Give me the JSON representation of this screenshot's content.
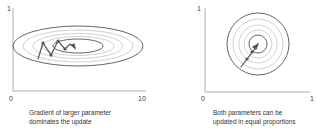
{
  "left_panel": {
    "y_tick_top": "1",
    "x_tick_left": "0",
    "x_tick_right": "10",
    "caption_line1": "Gradient of larger parameter",
    "caption_line2": "dominates the update"
  },
  "right_panel": {
    "y_tick_top": "1",
    "x_tick_left": "0",
    "x_tick_right": "1",
    "caption_line1": "Both parameters can be",
    "caption_line2": "updated in equal proportions"
  },
  "colors": {
    "axis": "#888888",
    "contour_dark": "#555555",
    "contour_light": "#bbbbbb",
    "path": "#555555"
  }
}
